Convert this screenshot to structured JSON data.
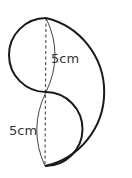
{
  "diagram": {
    "labels": {
      "upper": "5cm",
      "lower": "5cm"
    },
    "colors": {
      "stroke": "#1a1a1a",
      "dashed": "#555555",
      "text": "#333333"
    },
    "points": {
      "top": [
        46,
        18
      ],
      "middle": [
        46,
        92
      ],
      "bottom": [
        45,
        166
      ]
    }
  }
}
